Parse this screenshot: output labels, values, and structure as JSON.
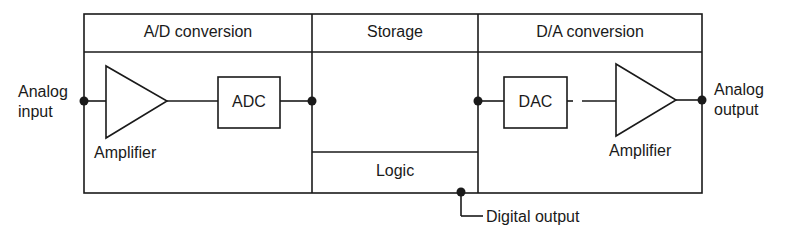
{
  "diagram": {
    "sections": [
      {
        "label": "A/D conversion"
      },
      {
        "label": "Storage"
      },
      {
        "label": "D/A conversion"
      }
    ],
    "logic_label": "Logic",
    "input_label": [
      "Analog",
      "input"
    ],
    "output_label": [
      "Analog",
      "output"
    ],
    "adc_label": "ADC",
    "dac_label": "DAC",
    "amplifier_left_label": "Amplifier",
    "amplifier_right_label": "Amplifier",
    "digital_output_label": "Digital output",
    "line_color": "#1a1a1a"
  }
}
